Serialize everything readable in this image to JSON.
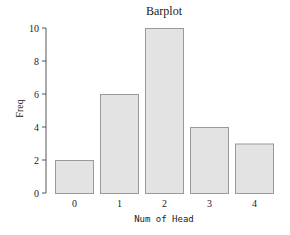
{
  "chart_data": {
    "type": "bar",
    "title": "Barplot",
    "xlabel": "Num of Head",
    "ylabel": "Freq",
    "categories": [
      "0",
      "1",
      "2",
      "3",
      "4"
    ],
    "values": [
      2,
      6,
      10,
      4,
      3
    ],
    "ylim": [
      0,
      10
    ],
    "yticks": [
      0,
      2,
      4,
      6,
      8,
      10
    ],
    "grid": false,
    "legend": null,
    "colors": {
      "bar_fill": "#e3e3e3",
      "bar_border": "#9a9a9a",
      "axis": "#555555"
    }
  },
  "header": {
    "title": "Barplot"
  },
  "axes": {
    "x_label": "Num of Head",
    "y_label": "Freq"
  }
}
